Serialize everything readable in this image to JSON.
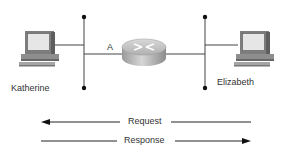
{
  "diagram": {
    "hosts": [
      {
        "name": "Katherine",
        "role": "computer"
      },
      {
        "name": "Elizabeth",
        "role": "computer"
      }
    ],
    "router": {
      "icon": "router-icon"
    },
    "link_label": "A",
    "arrows": [
      {
        "label": "Request",
        "direction": "left"
      },
      {
        "label": "Response",
        "direction": "right"
      }
    ],
    "colors": {
      "line": "#444444",
      "device": "#8a8a8a",
      "screen": "#e6e6e6"
    }
  }
}
